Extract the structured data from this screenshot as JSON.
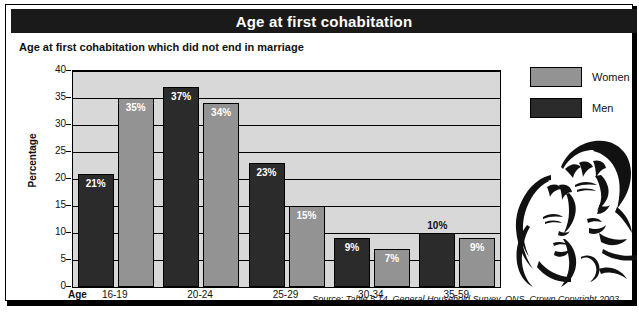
{
  "header": {
    "title": "Age at first cohabitation"
  },
  "subtitle": "Age at first cohabitation which did not end in marriage",
  "axis": {
    "y_title": "Percentage",
    "x_title": "Age"
  },
  "legend": {
    "items": [
      {
        "label": "Women",
        "color": "#939393",
        "swatch_name": "legend-swatch-women"
      },
      {
        "label": "Men",
        "color": "#2b2b2b",
        "swatch_name": "legend-swatch-men"
      }
    ]
  },
  "illustration": {
    "name": "couple-line-art-illustration",
    "description": "Line drawing of a man and a woman embracing"
  },
  "source_note": "Source: Table 5.14, General Household Survey, ONS. Crown Copyright 2003",
  "chart_data": {
    "type": "bar",
    "title": "Age at first cohabitation",
    "subtitle": "Age at first cohabitation which did not end in marriage",
    "xlabel": "Age",
    "ylabel": "Percentage",
    "ylim": [
      0,
      40
    ],
    "yticks": [
      0,
      5,
      10,
      15,
      20,
      25,
      30,
      35,
      40
    ],
    "ytick_labels": [
      "0",
      "5",
      "10",
      "15",
      "20",
      "25",
      "30",
      "35",
      "40"
    ],
    "grid": true,
    "legend_position": "right",
    "categories": [
      "16-19",
      "20-24",
      "25-29",
      "30-34",
      "35-59"
    ],
    "series": [
      {
        "name": "Men",
        "color": "#2b2b2b",
        "values": [
          21,
          37,
          23,
          9,
          10
        ],
        "data_labels": [
          "21%",
          "37%",
          "23%",
          "9%",
          "10%"
        ],
        "label_placement": [
          "inside",
          "inside",
          "inside",
          "inside",
          "outside"
        ]
      },
      {
        "name": "Women",
        "color": "#939393",
        "values": [
          35,
          34,
          15,
          7,
          9
        ],
        "data_labels": [
          "35%",
          "34%",
          "15%",
          "7%",
          "9%"
        ],
        "label_placement": [
          "inside",
          "inside",
          "inside",
          "inside",
          "inside"
        ]
      }
    ]
  }
}
